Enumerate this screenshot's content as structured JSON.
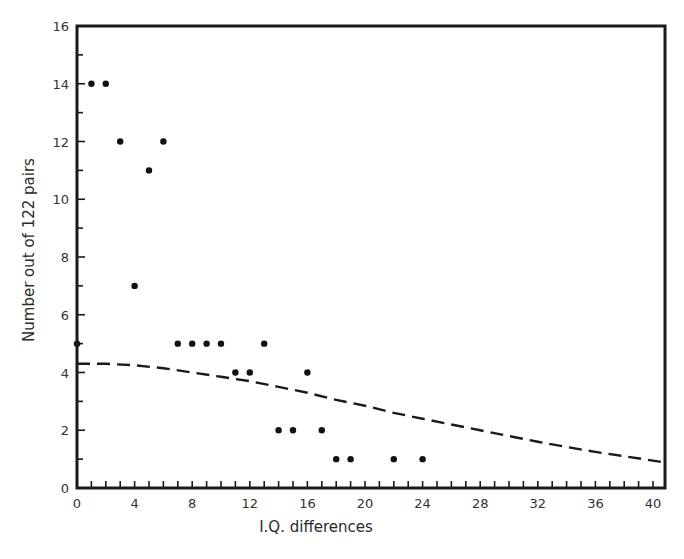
{
  "chart_data": {
    "type": "scatter",
    "title": "",
    "xlabel": "I.Q. differences",
    "ylabel": "Number out of 122 pairs",
    "xlim": [
      0,
      41
    ],
    "ylim": [
      0,
      16
    ],
    "x_ticks": [
      0,
      4,
      8,
      12,
      16,
      20,
      24,
      28,
      32,
      36,
      40
    ],
    "x_minor_step": 1,
    "y_ticks": [
      0,
      2,
      4,
      6,
      8,
      10,
      12,
      14,
      16
    ],
    "y_minor_step": 1,
    "grid": false,
    "legend": null,
    "series": [
      {
        "name": "Observed pairs",
        "type": "scatter",
        "points": [
          {
            "x": 0,
            "y": 5
          },
          {
            "x": 1,
            "y": 14
          },
          {
            "x": 2,
            "y": 14
          },
          {
            "x": 3,
            "y": 12
          },
          {
            "x": 4,
            "y": 7
          },
          {
            "x": 5,
            "y": 11
          },
          {
            "x": 6,
            "y": 12
          },
          {
            "x": 7,
            "y": 5
          },
          {
            "x": 8,
            "y": 5
          },
          {
            "x": 9,
            "y": 5
          },
          {
            "x": 10,
            "y": 5
          },
          {
            "x": 11,
            "y": 4
          },
          {
            "x": 12,
            "y": 4
          },
          {
            "x": 13,
            "y": 5
          },
          {
            "x": 14,
            "y": 2
          },
          {
            "x": 15,
            "y": 2
          },
          {
            "x": 16,
            "y": 4
          },
          {
            "x": 17,
            "y": 2
          },
          {
            "x": 18,
            "y": 1
          },
          {
            "x": 19,
            "y": 1
          },
          {
            "x": 22,
            "y": 1
          },
          {
            "x": 24,
            "y": 1
          }
        ]
      },
      {
        "name": "Expected distribution (dashed curve)",
        "type": "line",
        "style": "dashed",
        "points": [
          {
            "x": 0,
            "y": 4.3
          },
          {
            "x": 2,
            "y": 4.3
          },
          {
            "x": 4,
            "y": 4.25
          },
          {
            "x": 6,
            "y": 4.15
          },
          {
            "x": 8,
            "y": 4.0
          },
          {
            "x": 10,
            "y": 3.85
          },
          {
            "x": 12,
            "y": 3.7
          },
          {
            "x": 14,
            "y": 3.5
          },
          {
            "x": 16,
            "y": 3.3
          },
          {
            "x": 18,
            "y": 3.05
          },
          {
            "x": 20,
            "y": 2.85
          },
          {
            "x": 22,
            "y": 2.6
          },
          {
            "x": 24,
            "y": 2.4
          },
          {
            "x": 26,
            "y": 2.2
          },
          {
            "x": 28,
            "y": 2.0
          },
          {
            "x": 30,
            "y": 1.8
          },
          {
            "x": 32,
            "y": 1.6
          },
          {
            "x": 34,
            "y": 1.42
          },
          {
            "x": 36,
            "y": 1.25
          },
          {
            "x": 38,
            "y": 1.1
          },
          {
            "x": 40,
            "y": 0.95
          },
          {
            "x": 40.6,
            "y": 0.9
          }
        ]
      }
    ]
  },
  "labels": {
    "x_axis_title": "I.Q. differences",
    "y_axis_title": "Number out of 122 pairs"
  }
}
